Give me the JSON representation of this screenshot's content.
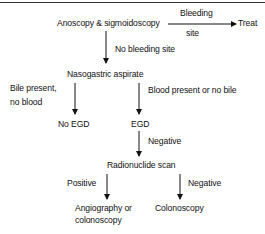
{
  "diagram": {
    "type": "flowchart",
    "nodes": {
      "start": "Anoscopy & sigmoidoscopy",
      "treat": "Treat",
      "ng_aspirate": "Nasogastric aspirate",
      "no_egd": "No EGD",
      "egd": "EGD",
      "radionuclide": "Radionuclide scan",
      "angio": [
        "Angiography or",
        "colonoscopy"
      ],
      "colonoscopy": "Colonoscopy"
    },
    "edges": {
      "bleeding_site": [
        "Bleeding",
        "site"
      ],
      "no_bleeding_site": "No bleeding site",
      "bile_present": [
        "Bile present,",
        "no blood"
      ],
      "blood_present": "Blood present or no bile",
      "egd_negative": "Negative",
      "scan_positive": "Positive",
      "scan_negative": "Negative"
    },
    "colors": {
      "line": "#111111",
      "text": "#111111",
      "background": "#ffffff"
    }
  }
}
